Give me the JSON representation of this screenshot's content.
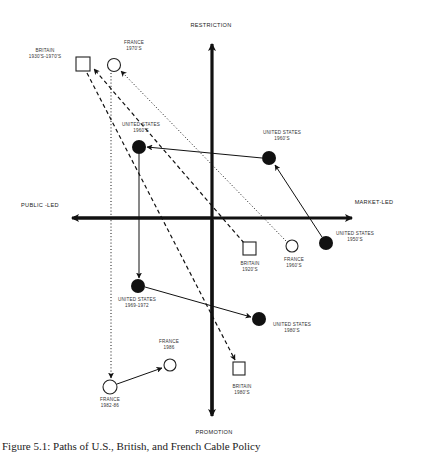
{
  "axes": {
    "top": "RESTRICTION",
    "bottom": "PROMOTION",
    "left": "PUBLIC -LED",
    "right": "MARKET-LED"
  },
  "nodes": [
    {
      "id": "britain_1930s_1970s",
      "country": "BRITAIN",
      "period": "1930'S-1970'S",
      "shape": "square",
      "x": 83,
      "y": 64
    },
    {
      "id": "france_1970s",
      "country": "FRANCE",
      "period": "1970'S",
      "shape": "circle-open",
      "x": 114,
      "y": 65
    },
    {
      "id": "us_1960s_left",
      "country": "UNITED STATES",
      "period": "1960'S",
      "shape": "circle-filled",
      "x": 139,
      "y": 147
    },
    {
      "id": "us_1960s_right",
      "country": "UNITED STATES",
      "period": "1960'S",
      "shape": "circle-filled",
      "x": 269,
      "y": 158
    },
    {
      "id": "us_1950s",
      "country": "UNITED STATES",
      "period": "1950'S",
      "shape": "circle-filled",
      "x": 326,
      "y": 243
    },
    {
      "id": "britain_1920s",
      "country": "BRITAIN",
      "period": "1920'S",
      "shape": "square",
      "x": 250,
      "y": 249
    },
    {
      "id": "france_1960s",
      "country": "FRANCE",
      "period": "1960'S",
      "shape": "circle-open",
      "x": 292,
      "y": 246
    },
    {
      "id": "us_1969_1972",
      "country": "UNITED STATES",
      "period": "1969-1972",
      "shape": "circle-filled",
      "x": 138,
      "y": 286
    },
    {
      "id": "us_1980s",
      "country": "UNITED STATES",
      "period": "1980'S",
      "shape": "circle-filled",
      "x": 259,
      "y": 319
    },
    {
      "id": "france_1986",
      "country": "FRANCE",
      "period": "1986",
      "shape": "circle-open",
      "x": 170,
      "y": 365
    },
    {
      "id": "france_1982_86",
      "country": "FRANCE",
      "period": "1982-86",
      "shape": "circle-open",
      "x": 110,
      "y": 387
    },
    {
      "id": "britain_1980s",
      "country": "BRITAIN",
      "period": "1980'S",
      "shape": "square",
      "x": 239,
      "y": 369
    }
  ],
  "paths": [
    {
      "from": "us_1950s",
      "to": "us_1960s_right",
      "style": "solid"
    },
    {
      "from": "us_1960s_right",
      "to": "us_1960s_left",
      "style": "solid"
    },
    {
      "from": "us_1960s_left",
      "to": "us_1969_1972",
      "style": "solid"
    },
    {
      "from": "us_1969_1972",
      "to": "us_1980s",
      "style": "solid"
    },
    {
      "from": "britain_1920s",
      "to": "britain_1930s_1970s",
      "style": "dashed"
    },
    {
      "from": "britain_1930s_1970s",
      "to": "britain_1980s",
      "style": "dashed"
    },
    {
      "from": "france_1960s",
      "to": "france_1970s",
      "style": "dotted"
    },
    {
      "from": "france_1970s",
      "to": "france_1982_86",
      "style": "dotted"
    },
    {
      "from": "france_1982_86",
      "to": "france_1986",
      "style": "solid"
    }
  ],
  "caption": "Figure 5.1: Paths of U.S., British, and French Cable Policy"
}
